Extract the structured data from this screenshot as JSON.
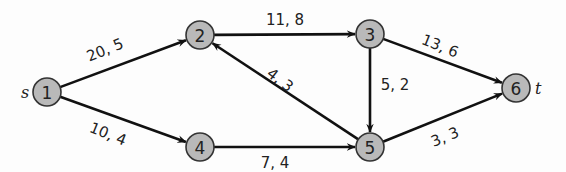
{
  "diagram": {
    "type": "flow-network",
    "background": "#fdfdfd",
    "node_fill": "#b9b9b9",
    "edge_color": "#111111",
    "nodes": [
      {
        "id": "1",
        "label": "1",
        "x": 47,
        "y": 92,
        "terminal": "s"
      },
      {
        "id": "2",
        "label": "2",
        "x": 200,
        "y": 35
      },
      {
        "id": "3",
        "label": "3",
        "x": 370,
        "y": 34
      },
      {
        "id": "4",
        "label": "4",
        "x": 200,
        "y": 147
      },
      {
        "id": "5",
        "label": "5",
        "x": 370,
        "y": 147
      },
      {
        "id": "6",
        "label": "6",
        "x": 516,
        "y": 88,
        "terminal": "t"
      }
    ],
    "edges": [
      {
        "from": "1",
        "to": "2",
        "label": "20, 5",
        "lx": 105,
        "ly": 50,
        "rot": -22
      },
      {
        "from": "1",
        "to": "4",
        "label": "10, 4",
        "lx": 108,
        "ly": 134,
        "rot": 22
      },
      {
        "from": "2",
        "to": "3",
        "label": "11, 8",
        "lx": 285,
        "ly": 20,
        "rot": 0
      },
      {
        "from": "5",
        "to": "2",
        "label": "4, 3",
        "lx": 280,
        "ly": 80,
        "rot": 38
      },
      {
        "from": "3",
        "to": "5",
        "label": "5, 2",
        "lx": 395,
        "ly": 85,
        "rot": 0
      },
      {
        "from": "3",
        "to": "6",
        "label": "13, 6",
        "lx": 440,
        "ly": 46,
        "rot": 22
      },
      {
        "from": "4",
        "to": "5",
        "label": "7, 4",
        "lx": 275,
        "ly": 163,
        "rot": 0
      },
      {
        "from": "5",
        "to": "6",
        "label": "3, 3",
        "lx": 445,
        "ly": 137,
        "rot": -22
      }
    ],
    "terminals": {
      "source": "s",
      "sink": "t"
    }
  }
}
